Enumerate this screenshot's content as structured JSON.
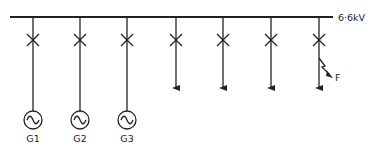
{
  "diagram": {
    "type": "single-line power system diagram",
    "bus": {
      "label": "6·6kV",
      "x1": 10,
      "x2": 333,
      "y": 17
    },
    "feeders": [
      {
        "x": 33,
        "kind": "generator",
        "label": "G1"
      },
      {
        "x": 80,
        "kind": "generator",
        "label": "G2"
      },
      {
        "x": 127,
        "kind": "generator",
        "label": "G3"
      },
      {
        "x": 176,
        "kind": "load"
      },
      {
        "x": 223,
        "kind": "load"
      },
      {
        "x": 271,
        "kind": "load"
      },
      {
        "x": 319,
        "kind": "load",
        "fault": true,
        "fault_label": "F"
      }
    ],
    "breaker_y": 40,
    "colors": {
      "line": "#222222",
      "background": "#ffffff"
    }
  }
}
